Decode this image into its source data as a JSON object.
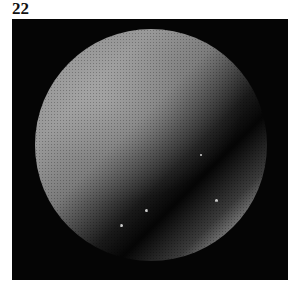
{
  "figure": {
    "label": "22"
  },
  "image": {
    "description": "Grayscale telescope image of a planetary disc (Venus/Saturn-like) on black background, bright upper-left, dark diagonal band, bright crescent lower-right",
    "colors": {
      "background": "#050505",
      "disc_light": "#9a9a9a",
      "crescent": "#d0d0d0"
    }
  }
}
